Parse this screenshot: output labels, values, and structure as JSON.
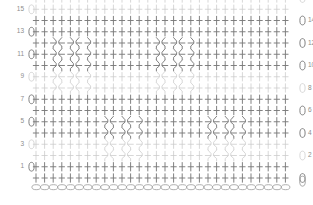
{
  "chart_data": {
    "type": "diagram",
    "subtype": "crochet-symbol-chart",
    "grid": {
      "rows": 16,
      "stitches_per_row": 30,
      "col_start_x": 36,
      "col_step": 8.6,
      "row_bottom_y": 178,
      "row_step": 11.25
    },
    "colors": {
      "dark_stitch": "#7a7a7a",
      "light_stitch": "#c9c9c9",
      "cable_line": "#7c7c7c",
      "chain_outline": "#a0a0a0",
      "label_text": "#8d8d8d",
      "background": "#ffffff"
    },
    "row_labels_left": [
      "15",
      "13",
      "11",
      "9",
      "7",
      "5",
      "3",
      "1"
    ],
    "row_labels_right": [
      "14",
      "12",
      "10",
      "8",
      "6",
      "4",
      "2"
    ],
    "legend_symbols": [
      {
        "name": "chain-stitch",
        "glyph": "oval",
        "meaning": "chain"
      },
      {
        "name": "single-crochet",
        "glyph": "plus",
        "meaning": "single crochet"
      },
      {
        "name": "front-post-stitch",
        "glyph": "zigzag-post",
        "meaning": "front post crossed stitch"
      }
    ],
    "rows": [
      {
        "index": 16,
        "label": "",
        "side": "even",
        "shade": "light",
        "turning_chain": "right",
        "cables": []
      },
      {
        "index": 15,
        "label": "15",
        "side": "odd",
        "shade": "light",
        "turning_chain": "left",
        "cables": []
      },
      {
        "index": 14,
        "label": "14",
        "side": "even",
        "shade": "dark",
        "turning_chain": "right",
        "cables": []
      },
      {
        "index": 13,
        "label": "13",
        "side": "odd",
        "shade": "dark",
        "turning_chain": "left",
        "cables": []
      },
      {
        "index": 12,
        "label": "12",
        "side": "even",
        "shade": "dark",
        "turning_chain": "right",
        "cables": [
          {
            "start": 2,
            "count": 5
          },
          {
            "start": 14,
            "count": 5
          }
        ]
      },
      {
        "index": 11,
        "label": "11",
        "side": "odd",
        "shade": "dark",
        "turning_chain": "left",
        "cables": [
          {
            "start": 2,
            "count": 5
          },
          {
            "start": 14,
            "count": 5
          }
        ]
      },
      {
        "index": 10,
        "label": "10",
        "side": "even",
        "shade": "dark",
        "turning_chain": "right",
        "cables": [
          {
            "start": 2,
            "count": 5
          },
          {
            "start": 14,
            "count": 5
          }
        ]
      },
      {
        "index": 9,
        "label": "9",
        "side": "odd",
        "shade": "light",
        "turning_chain": "left",
        "cables": [
          {
            "start": 2,
            "count": 5
          },
          {
            "start": 14,
            "count": 5
          }
        ]
      },
      {
        "index": 8,
        "label": "8",
        "side": "even",
        "shade": "light",
        "turning_chain": "right",
        "cables": [
          {
            "start": 2,
            "count": 5
          },
          {
            "start": 14,
            "count": 5
          }
        ]
      },
      {
        "index": 7,
        "label": "7",
        "side": "odd",
        "shade": "dark",
        "turning_chain": "left",
        "cables": []
      },
      {
        "index": 6,
        "label": "6",
        "side": "even",
        "shade": "dark",
        "turning_chain": "right",
        "cables": []
      },
      {
        "index": 5,
        "label": "5",
        "side": "odd",
        "shade": "dark",
        "turning_chain": "left",
        "cables": [
          {
            "start": 8,
            "count": 5
          },
          {
            "start": 20,
            "count": 5
          }
        ]
      },
      {
        "index": 4,
        "label": "4",
        "side": "even",
        "shade": "dark",
        "turning_chain": "right",
        "cables": [
          {
            "start": 8,
            "count": 5
          },
          {
            "start": 20,
            "count": 5
          }
        ]
      },
      {
        "index": 3,
        "label": "3",
        "side": "odd",
        "shade": "light",
        "turning_chain": "left",
        "cables": [
          {
            "start": 8,
            "count": 5
          },
          {
            "start": 20,
            "count": 5
          }
        ]
      },
      {
        "index": 2,
        "label": "2",
        "side": "even",
        "shade": "light",
        "turning_chain": "right",
        "cables": [
          {
            "start": 8,
            "count": 5
          },
          {
            "start": 20,
            "count": 5
          }
        ]
      },
      {
        "index": 1,
        "label": "1",
        "side": "odd",
        "shade": "dark",
        "turning_chain": "left",
        "cables": []
      },
      {
        "index": 0,
        "label": "",
        "side": "even",
        "shade": "dark",
        "turning_chain": "right",
        "cables": []
      }
    ],
    "foundation_chain": {
      "count": 30,
      "symbol": "oval",
      "label": "foundation chain"
    }
  }
}
